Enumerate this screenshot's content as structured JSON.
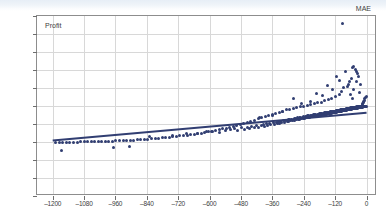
{
  "window": {
    "top_band_color": "#e7eef6"
  },
  "chart_data": {
    "type": "scatter",
    "title": "",
    "xlabel": "MAE",
    "ylabel": "Profit",
    "xlim": [
      -1260,
      40
    ],
    "ylim": [
      -2300,
      2300
    ],
    "xticks": [
      -1200,
      -1080,
      -960,
      -840,
      -720,
      -600,
      -480,
      -360,
      -240,
      -120,
      0
    ],
    "yticks": [
      2300,
      1840,
      1380,
      920,
      460,
      0,
      -460,
      -920,
      -1380,
      -1840,
      -2300
    ],
    "xtick_labels": [
      "–1200",
      "–1080",
      "–960",
      "–840",
      "–720",
      "–600",
      "–480",
      "–360",
      "–240",
      "–120",
      "0"
    ],
    "ytick_labels": [
      "2300",
      "1840",
      "1380",
      "920",
      "460",
      "0",
      "–460",
      "–920",
      "–1380",
      "–1840",
      "–2300"
    ],
    "grid": true,
    "legend": "none",
    "point_color": "#313e72",
    "point_size": 3,
    "grid_color": "#d8d8d8",
    "frame_color": "#8d8d8d",
    "trendline": {
      "visible": true,
      "color": "#313e72",
      "width": 2,
      "x_start": -1200,
      "y_start": -880,
      "x_end": 0,
      "y_end": -170
    },
    "points": [
      [
        -1165,
        -1140
      ],
      [
        -968,
        -1062
      ],
      [
        -905,
        -1040
      ],
      [
        -828,
        -770
      ],
      [
        -742,
        -745
      ],
      [
        -690,
        -700
      ],
      [
        -648,
        -690
      ],
      [
        -612,
        -662
      ],
      [
        -588,
        -640
      ],
      [
        -561,
        -680
      ],
      [
        -540,
        -620
      ],
      [
        -520,
        -600
      ],
      [
        -505,
        -585
      ],
      [
        -492,
        -630
      ],
      [
        -478,
        -560
      ],
      [
        -466,
        -600
      ],
      [
        -455,
        -540
      ],
      [
        -447,
        -575
      ],
      [
        -438,
        -520
      ],
      [
        -430,
        -560
      ],
      [
        -422,
        -500
      ],
      [
        -415,
        -540
      ],
      [
        -408,
        -300
      ],
      [
        -402,
        -495
      ],
      [
        -395,
        -470
      ],
      [
        -389,
        -520
      ],
      [
        -383,
        -455
      ],
      [
        -377,
        -490
      ],
      [
        -371,
        -440
      ],
      [
        -366,
        -480
      ],
      [
        -360,
        -240
      ],
      [
        -356,
        -430
      ],
      [
        -351,
        -465
      ],
      [
        -346,
        -415
      ],
      [
        -341,
        -450
      ],
      [
        -337,
        -400
      ],
      [
        -332,
        -435
      ],
      [
        -328,
        -390
      ],
      [
        -324,
        -425
      ],
      [
        -320,
        -140
      ],
      [
        -316,
        -380
      ],
      [
        -312,
        -415
      ],
      [
        -308,
        -370
      ],
      [
        -304,
        -405
      ],
      [
        -300,
        -355
      ],
      [
        -297,
        -392
      ],
      [
        -293,
        -345
      ],
      [
        -290,
        -380
      ],
      [
        -286,
        -335
      ],
      [
        -283,
        -372
      ],
      [
        -280,
        200
      ],
      [
        -277,
        -325
      ],
      [
        -274,
        -360
      ],
      [
        -270,
        -315
      ],
      [
        -267,
        -350
      ],
      [
        -264,
        -305
      ],
      [
        -261,
        -345
      ],
      [
        -258,
        -298
      ],
      [
        -256,
        -335
      ],
      [
        -253,
        -290
      ],
      [
        -250,
        -330
      ],
      [
        -247,
        60
      ],
      [
        -245,
        -282
      ],
      [
        -242,
        -320
      ],
      [
        -240,
        -275
      ],
      [
        -237,
        -312
      ],
      [
        -235,
        -268
      ],
      [
        -232,
        -305
      ],
      [
        -230,
        -262
      ],
      [
        -228,
        -298
      ],
      [
        -225,
        -255
      ],
      [
        -223,
        -292
      ],
      [
        -221,
        -248
      ],
      [
        -219,
        -285
      ],
      [
        -216,
        120
      ],
      [
        -214,
        -242
      ],
      [
        -212,
        -280
      ],
      [
        -210,
        -236
      ],
      [
        -208,
        -272
      ],
      [
        -206,
        -230
      ],
      [
        -204,
        -268
      ],
      [
        -202,
        -225
      ],
      [
        -200,
        -262
      ],
      [
        -198,
        -220
      ],
      [
        -196,
        -256
      ],
      [
        -194,
        -214
      ],
      [
        -192,
        -250
      ],
      [
        -190,
        320
      ],
      [
        -188,
        -210
      ],
      [
        -186,
        -245
      ],
      [
        -184,
        -205
      ],
      [
        -183,
        -240
      ],
      [
        -181,
        -200
      ],
      [
        -179,
        -236
      ],
      [
        -177,
        -196
      ],
      [
        -176,
        -230
      ],
      [
        -174,
        -192
      ],
      [
        -172,
        -226
      ],
      [
        -171,
        -188
      ],
      [
        -169,
        -222
      ],
      [
        -167,
        260
      ],
      [
        -166,
        -184
      ],
      [
        -164,
        -218
      ],
      [
        -163,
        -180
      ],
      [
        -161,
        -214
      ],
      [
        -160,
        -176
      ],
      [
        -158,
        -210
      ],
      [
        -157,
        -172
      ],
      [
        -155,
        -206
      ],
      [
        -154,
        -169
      ],
      [
        -152,
        -202
      ],
      [
        -151,
        -166
      ],
      [
        -150,
        -198
      ],
      [
        -148,
        520
      ],
      [
        -147,
        -162
      ],
      [
        -146,
        -194
      ],
      [
        -144,
        -159
      ],
      [
        -143,
        -190
      ],
      [
        -142,
        -156
      ],
      [
        -140,
        -186
      ],
      [
        -139,
        -152
      ],
      [
        -138,
        -183
      ],
      [
        -136,
        -150
      ],
      [
        -135,
        -180
      ],
      [
        -134,
        -146
      ],
      [
        -133,
        -176
      ],
      [
        -131,
        420
      ],
      [
        -130,
        -143
      ],
      [
        -129,
        -173
      ],
      [
        -128,
        -140
      ],
      [
        -127,
        -170
      ],
      [
        -125,
        -137
      ],
      [
        -124,
        -166
      ],
      [
        -123,
        -134
      ],
      [
        -122,
        -163
      ],
      [
        -121,
        -131
      ],
      [
        -120,
        -160
      ],
      [
        -118,
        -128
      ],
      [
        -117,
        -157
      ],
      [
        -116,
        760
      ],
      [
        -115,
        -125
      ],
      [
        -114,
        -154
      ],
      [
        -113,
        -122
      ],
      [
        -112,
        -151
      ],
      [
        -111,
        -119
      ],
      [
        -110,
        -148
      ],
      [
        -109,
        -116
      ],
      [
        -108,
        -145
      ],
      [
        -107,
        -113
      ],
      [
        -106,
        -142
      ],
      [
        -105,
        -110
      ],
      [
        -104,
        -139
      ],
      [
        -103,
        640
      ],
      [
        -102,
        -107
      ],
      [
        -101,
        -136
      ],
      [
        -100,
        -104
      ],
      [
        -99,
        -133
      ],
      [
        -98,
        -101
      ],
      [
        -97,
        -130
      ],
      [
        -96,
        -98
      ],
      [
        -95,
        -127
      ],
      [
        -94,
        -95
      ],
      [
        -93,
        -124
      ],
      [
        -92,
        2120
      ],
      [
        -91,
        -92
      ],
      [
        -90,
        -121
      ],
      [
        -89,
        -89
      ],
      [
        -88,
        -118
      ],
      [
        -87,
        -86
      ],
      [
        -86,
        -115
      ],
      [
        -85,
        -83
      ],
      [
        -84,
        -112
      ],
      [
        -83,
        -80
      ],
      [
        -82,
        -109
      ],
      [
        -81,
        880
      ],
      [
        -80,
        -77
      ],
      [
        -79,
        -106
      ],
      [
        -78,
        -74
      ],
      [
        -77,
        -103
      ],
      [
        -76,
        -71
      ],
      [
        -75,
        -100
      ],
      [
        -74,
        -68
      ],
      [
        -73,
        -97
      ],
      [
        -72,
        -65
      ],
      [
        -71,
        -94
      ],
      [
        -70,
        540
      ],
      [
        -69,
        -62
      ],
      [
        -68,
        -91
      ],
      [
        -67,
        -59
      ],
      [
        -66,
        -88
      ],
      [
        -65,
        -56
      ],
      [
        -64,
        -85
      ],
      [
        -63,
        300
      ],
      [
        -62,
        -53
      ],
      [
        -61,
        -82
      ],
      [
        -60,
        -50
      ],
      [
        -59,
        -79
      ],
      [
        -58,
        700
      ],
      [
        -57,
        -47
      ],
      [
        -56,
        -76
      ],
      [
        -55,
        -44
      ],
      [
        -54,
        -73
      ],
      [
        -53,
        180
      ],
      [
        -52,
        -41
      ],
      [
        -51,
        -70
      ],
      [
        -50,
        -38
      ],
      [
        -49,
        -67
      ],
      [
        -48,
        420
      ],
      [
        -47,
        -35
      ],
      [
        -46,
        -64
      ],
      [
        -45,
        -32
      ],
      [
        -44,
        -61
      ],
      [
        -43,
        940
      ],
      [
        -42,
        -29
      ],
      [
        -41,
        -58
      ],
      [
        -40,
        -26
      ],
      [
        -39,
        -55
      ],
      [
        -38,
        620
      ],
      [
        -37,
        -23
      ],
      [
        -36,
        -52
      ],
      [
        -35,
        -20
      ],
      [
        -34,
        -49
      ],
      [
        -33,
        820
      ],
      [
        -32,
        -17
      ],
      [
        -31,
        -46
      ],
      [
        -30,
        -14
      ],
      [
        -29,
        -43
      ],
      [
        -28,
        340
      ],
      [
        -27,
        -11
      ],
      [
        -26,
        -40
      ],
      [
        -25,
        -8
      ],
      [
        -24,
        -37
      ],
      [
        -23,
        560
      ],
      [
        -22,
        -5
      ],
      [
        -21,
        -34
      ],
      [
        -20,
        -2
      ],
      [
        -19,
        -31
      ],
      [
        -18,
        0
      ],
      [
        -17,
        -28
      ],
      [
        -16,
        30
      ],
      [
        -15,
        -25
      ],
      [
        -14,
        60
      ],
      [
        -13,
        -22
      ],
      [
        -12,
        90
      ],
      [
        -11,
        -19
      ],
      [
        -10,
        120
      ],
      [
        -9,
        -16
      ],
      [
        -8,
        150
      ],
      [
        -7,
        -13
      ],
      [
        -6,
        180
      ],
      [
        -5,
        -10
      ],
      [
        -4,
        210
      ],
      [
        -3,
        -7
      ],
      [
        -2,
        240
      ],
      [
        -1,
        -4
      ],
      [
        -55,
        980
      ],
      [
        -48,
        1020
      ],
      [
        -30,
        760
      ],
      [
        -38,
        880
      ],
      [
        -66,
        620
      ],
      [
        -74,
        500
      ],
      [
        -88,
        480
      ],
      [
        -97,
        360
      ],
      [
        -105,
        300
      ],
      [
        -119,
        240
      ],
      [
        -133,
        180
      ],
      [
        -146,
        160
      ],
      [
        -159,
        140
      ],
      [
        -172,
        100
      ],
      [
        -186,
        80
      ],
      [
        -199,
        60
      ],
      [
        -213,
        40
      ],
      [
        -226,
        20
      ],
      [
        -240,
        0
      ],
      [
        -253,
        -20
      ],
      [
        -267,
        -40
      ],
      [
        -280,
        -60
      ],
      [
        -294,
        -80
      ],
      [
        -307,
        -100
      ],
      [
        -321,
        -130
      ],
      [
        -334,
        -160
      ],
      [
        -348,
        -190
      ],
      [
        -361,
        -210
      ],
      [
        -375,
        -240
      ],
      [
        -388,
        -270
      ],
      [
        -402,
        -300
      ],
      [
        -415,
        -330
      ],
      [
        -429,
        -360
      ],
      [
        -442,
        -390
      ],
      [
        -456,
        -420
      ],
      [
        -470,
        -450
      ],
      [
        -483,
        -470
      ],
      [
        -497,
        -500
      ],
      [
        -510,
        -520
      ],
      [
        -524,
        -545
      ],
      [
        -537,
        -565
      ],
      [
        -551,
        -585
      ],
      [
        -564,
        -605
      ],
      [
        -578,
        -625
      ],
      [
        -592,
        -640
      ],
      [
        -605,
        -660
      ],
      [
        -619,
        -675
      ],
      [
        -632,
        -690
      ],
      [
        -646,
        -705
      ],
      [
        -659,
        -718
      ],
      [
        -673,
        -730
      ],
      [
        -686,
        -742
      ],
      [
        -700,
        -754
      ],
      [
        -714,
        -766
      ],
      [
        -727,
        -776
      ],
      [
        -741,
        -786
      ],
      [
        -754,
        -796
      ],
      [
        -768,
        -806
      ],
      [
        -781,
        -814
      ],
      [
        -795,
        -822
      ],
      [
        -808,
        -830
      ],
      [
        -822,
        -838
      ],
      [
        -836,
        -845
      ],
      [
        -849,
        -852
      ],
      [
        -863,
        -858
      ],
      [
        -876,
        -864
      ],
      [
        -890,
        -870
      ],
      [
        -903,
        -875
      ],
      [
        -917,
        -880
      ],
      [
        -930,
        -884
      ],
      [
        -944,
        -888
      ],
      [
        -958,
        -892
      ],
      [
        -971,
        -896
      ],
      [
        -985,
        -899
      ],
      [
        -998,
        -902
      ],
      [
        -1012,
        -905
      ],
      [
        -1025,
        -908
      ],
      [
        -1039,
        -911
      ],
      [
        -1052,
        -913
      ],
      [
        -1066,
        -915
      ],
      [
        -1080,
        -917
      ],
      [
        -1093,
        -919
      ],
      [
        -1107,
        -921
      ],
      [
        -1120,
        -923
      ],
      [
        -1134,
        -924
      ],
      [
        -1147,
        -926
      ],
      [
        -1161,
        -927
      ],
      [
        -1174,
        -928
      ],
      [
        -1188,
        -929
      ]
    ]
  }
}
